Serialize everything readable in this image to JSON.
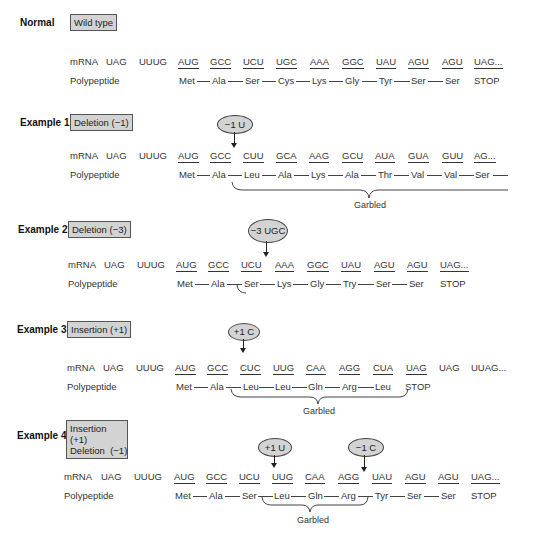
{
  "row_labels": {
    "mrna": "mRNA",
    "polypeptide": "Polypeptide",
    "garbled": "Garbled"
  },
  "examples": [
    {
      "label": "Normal",
      "type": "Wild type",
      "leader": [
        "UAG",
        "UUUG"
      ],
      "codons": [
        "AUG",
        "GCC",
        "UCU",
        "UGC",
        "AAA",
        "GGC",
        "UAU",
        "AGU",
        "AGU",
        "UAG..."
      ],
      "amino_acids": [
        "Met",
        "Ala",
        "Ser",
        "Cys",
        "Lys",
        "Gly",
        "Tyr",
        "Ser",
        "Ser",
        "STOP"
      ]
    },
    {
      "label": "Example 1",
      "type": "Deletion (−1)",
      "mutation": "−1 U",
      "leader": [
        "UAG",
        "UUUG"
      ],
      "codons": [
        "AUG",
        "GCC",
        "CUU",
        "GCA",
        "AAG",
        "GCU",
        "AUA",
        "GUA",
        "GUU",
        "AG..."
      ],
      "amino_acids": [
        "Met",
        "Ala",
        "Leu",
        "Ala",
        "Lys",
        "Ala",
        "Thr",
        "Val",
        "Val",
        "Ser"
      ]
    },
    {
      "label": "Example 2",
      "type": "Deletion (−3)",
      "mutation": "−3 UGC",
      "leader": [
        "UAG",
        "UUUG"
      ],
      "codons": [
        "AUG",
        "GCC",
        "UCU",
        "AAA",
        "GGC",
        "UAU",
        "AGU",
        "AGU",
        "UAG..."
      ],
      "amino_acids": [
        "Met",
        "Ala",
        "Ser",
        "Lys",
        "Gly",
        "Try",
        "Ser",
        "Ser",
        "STOP"
      ]
    },
    {
      "label": "Example 3",
      "type": "Insertion (+1)",
      "mutation": "+1 C",
      "leader": [
        "UAG",
        "UUUG"
      ],
      "codons": [
        "AUG",
        "GCC",
        "CUC",
        "UUG",
        "CAA",
        "AGG",
        "CUA",
        "UAG",
        "UAG",
        "UUAG..."
      ],
      "amino_acids": [
        "Met",
        "Ala",
        "Leu",
        "Leu",
        "Gln",
        "Arg",
        "Leu",
        "STOP"
      ]
    },
    {
      "label": "Example 4",
      "type_line1": "Insertion (+1)",
      "type_line2": "Deletion  (−1)",
      "mutation1": "+1 U",
      "mutation2": "−1 C",
      "leader": [
        "UAG",
        "UUUG"
      ],
      "codons": [
        "AUG",
        "GCC",
        "UCU",
        "UUG",
        "CAA",
        "AGG",
        "UAU",
        "AGU",
        "AGU",
        "UAG..."
      ],
      "amino_acids": [
        "Met",
        "Ala",
        "Ser",
        "Leu",
        "Gln",
        "Arg",
        "Tyr",
        "Ser",
        "Ser",
        "STOP"
      ]
    }
  ]
}
